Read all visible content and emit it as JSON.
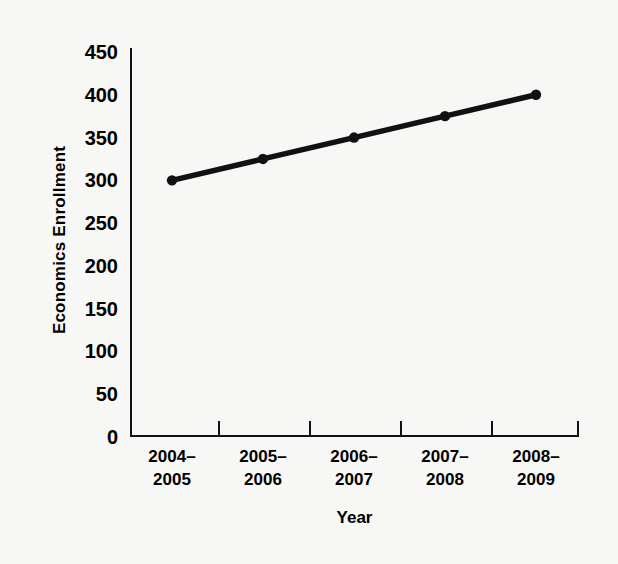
{
  "chart_data": {
    "type": "line",
    "title": "",
    "xlabel": "Year",
    "ylabel": "Economics Enrollment",
    "categories": [
      "2004–\n2005",
      "2005–\n2006",
      "2006–\n2007",
      "2007–\n2008",
      "2008–\n2009"
    ],
    "categories_flat": [
      "2004–2005",
      "2005–2006",
      "2006–2007",
      "2007–2008",
      "2008–2009"
    ],
    "values": [
      300,
      325,
      350,
      375,
      400
    ],
    "series": [
      {
        "name": "Economics Enrollment",
        "values": [
          300,
          325,
          350,
          375,
          400
        ],
        "color": "#111111",
        "marker": "circle"
      }
    ],
    "ylim": [
      0,
      450
    ],
    "yticks": [
      0,
      50,
      100,
      150,
      200,
      250,
      300,
      350,
      400,
      450
    ],
    "ytick_labels": [
      "0",
      "50",
      "100",
      "150",
      "200",
      "250",
      "300",
      "350",
      "400",
      "450"
    ],
    "grid": false,
    "legend": false,
    "legend_position": "none",
    "background_color": "#f7f7f5",
    "axis_color": "#111111"
  },
  "figure": {
    "y_axis_title": "Economics Enrollment",
    "x_axis_title": "Year"
  }
}
